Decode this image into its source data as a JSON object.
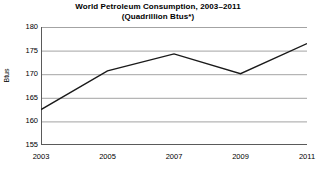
{
  "chart_data": {
    "type": "line",
    "title": "World Petroleum Consumption, 2003–2011",
    "subtitle": "(Quadrillion Btus*)",
    "xlabel": "",
    "ylabel": "Btus",
    "x": [
      2003,
      2005,
      2007,
      2009,
      2011
    ],
    "values": [
      162.5,
      170.7,
      174.3,
      170.1,
      176.5
    ],
    "series": [
      {
        "name": "World Petroleum Consumption",
        "values": [
          162.5,
          170.7,
          174.3,
          170.1,
          176.5
        ]
      }
    ],
    "xlim": [
      2003,
      2011
    ],
    "ylim": [
      155,
      180
    ],
    "x_tick_labels": [
      "2003",
      "2005",
      "2007",
      "2009",
      "2011"
    ],
    "y_tick_labels": [
      "155",
      "160",
      "165",
      "170",
      "175",
      "180"
    ],
    "y_ticks": [
      155,
      160,
      165,
      170,
      175,
      180
    ],
    "x_minor_ticks": [
      2004,
      2006,
      2008,
      2010
    ],
    "grid": "horizontal",
    "legend": "none",
    "line_color": "#1a1a1a",
    "markers": false
  },
  "axis": {
    "y_title": "Btus"
  }
}
